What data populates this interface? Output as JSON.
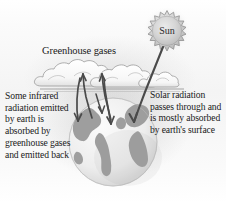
{
  "figure": {
    "background_color": "#ffffff"
  },
  "labels": {
    "greenhouse_gases": "Greenhouse gases",
    "sun": "Sun",
    "left_caption": "Some infrared radiation emitted by earth is absorbed by greenhouse gases and emitted back",
    "right_caption": "Solar radiation passes through and is mostly absorbed by earth's surface"
  },
  "elements": {
    "sun_name": "sun",
    "cloud_layer_name": "greenhouse-gas-cloud-layer",
    "earth_name": "earth-globe",
    "incoming_ray_name": "incoming-solar-radiation-arrow",
    "outgoing_rays_name": "infrared-radiation-arrows",
    "horizon_name": "atmosphere-horizon-line"
  },
  "colors": {
    "sun_fill": "#d0d0d0",
    "sun_outline": "#8f8f8f",
    "cloud_fill": "#fcfcfc",
    "cloud_outline": "#9a9a9a",
    "ocean_fill": "#f2f2f2",
    "land_fill": "#9e9e9e",
    "arrow_stroke": "#4a4a4a",
    "text": "#1a1a1a"
  }
}
